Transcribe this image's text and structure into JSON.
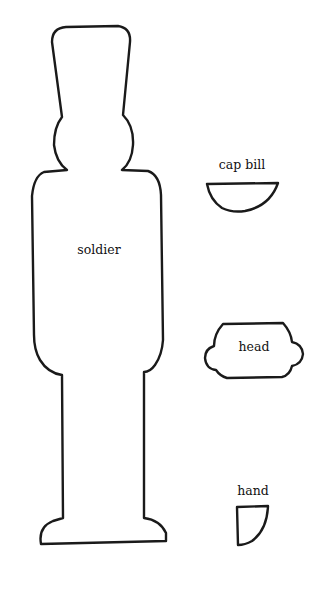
{
  "page": {
    "background": "#ffffff",
    "stroke_color": "#1a1a1a"
  },
  "pieces": [
    {
      "id": "soldier",
      "label": "soldier"
    },
    {
      "id": "cap-bill",
      "label": "cap bill"
    },
    {
      "id": "head",
      "label": "head"
    },
    {
      "id": "hand",
      "label": "hand"
    }
  ]
}
